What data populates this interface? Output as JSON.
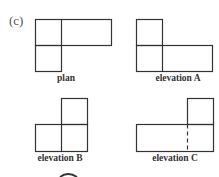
{
  "figure": {
    "part_label": "(c)",
    "stroke_color": "#333333",
    "views": [
      {
        "id": "plan",
        "label": "plan",
        "label_pos": [
          66,
          73
        ],
        "rects": [
          [
            35,
            19,
            76,
            26
          ],
          [
            35,
            45,
            26,
            26
          ]
        ],
        "lines": [
          [
            61,
            19,
            61,
            45
          ]
        ],
        "dashed": []
      },
      {
        "id": "elevation-a",
        "label": "elevation A",
        "label_pos": [
          178,
          73
        ],
        "rects": [
          [
            136,
            19,
            26,
            26
          ],
          [
            136,
            45,
            76,
            26
          ]
        ],
        "lines": [
          [
            162,
            45,
            162,
            71
          ]
        ],
        "dashed": []
      },
      {
        "id": "elevation-b",
        "label": "elevation B",
        "label_pos": [
          60,
          153
        ],
        "rects": [
          [
            61,
            98,
            26,
            26
          ],
          [
            35,
            124,
            52,
            27
          ]
        ],
        "lines": [
          [
            61,
            124,
            61,
            151
          ]
        ],
        "dashed": []
      },
      {
        "id": "elevation-c",
        "label": "elevation C",
        "label_pos": [
          175,
          153
        ],
        "rects": [
          [
            187,
            98,
            26,
            26
          ],
          [
            136,
            124,
            77,
            27
          ]
        ],
        "lines": [],
        "dashed": [
          [
            187,
            124,
            187,
            151
          ]
        ]
      }
    ]
  }
}
